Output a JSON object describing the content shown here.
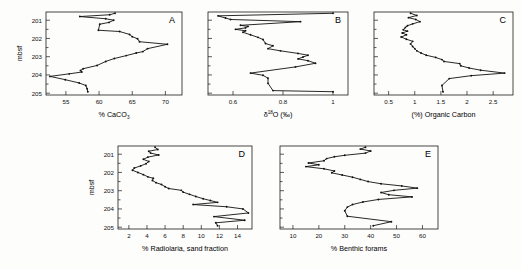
{
  "figure": {
    "background": "#fdfdfc",
    "line_color": "#111111",
    "axis_color": "#1a1a1a",
    "depth_axis_label": "mbsf",
    "depth_ticks": [
      201,
      202,
      203,
      204,
      205
    ],
    "depth_range": [
      200.55,
      205.1
    ]
  },
  "panels": [
    {
      "id": "A",
      "letter": "A",
      "xlabel_parts": {
        "pre": "% CaCO",
        "sub": "3",
        "post": ""
      },
      "xlabel": "% CaCO3",
      "ylabel": "mbsf",
      "xticks": [
        55,
        60,
        65,
        70
      ],
      "xlim": [
        52.0,
        72.5
      ],
      "ylim": [
        200.55,
        205.1
      ]
    },
    {
      "id": "B",
      "letter": "B",
      "xlabel_parts": {
        "pre": "δ",
        "sup": "18",
        "post": "O (‰)"
      },
      "xlabel": "δ18O (‰)",
      "ylabel": "",
      "xticks": [
        0.6,
        0.8,
        1.0
      ],
      "xlim": [
        0.5,
        1.06
      ],
      "ylim": [
        200.55,
        205.1
      ]
    },
    {
      "id": "C",
      "letter": "C",
      "xlabel_parts": {
        "pre": "(%) Organic Carbon"
      },
      "xlabel": "(%) Organic Carbon",
      "ylabel": "",
      "xticks": [
        0.5,
        1.0,
        1.5,
        2.0,
        2.5
      ],
      "xlim": [
        0.22,
        2.88
      ],
      "ylim": [
        200.55,
        205.1
      ]
    },
    {
      "id": "D",
      "letter": "D",
      "xlabel_parts": {
        "pre": "% Radiolaria, sand fraction"
      },
      "xlabel": "% Radiolaria, sand fraction",
      "ylabel": "mbsf",
      "xticks": [
        2,
        4,
        6,
        8,
        10,
        12,
        14
      ],
      "xlim": [
        0.8,
        15.6
      ],
      "ylim": [
        200.55,
        205.1
      ]
    },
    {
      "id": "E",
      "letter": "E",
      "xlabel_parts": {
        "pre": "% Benthic forams"
      },
      "xlabel": "% Benthic forams",
      "ylabel": "",
      "xticks": [
        10,
        20,
        30,
        40,
        50,
        60
      ],
      "xlim": [
        5,
        66
      ],
      "ylim": [
        200.55,
        205.1
      ]
    }
  ],
  "chart_data": [
    {
      "type": "line",
      "panel": "A",
      "title": "",
      "xlabel": "% CaCO3",
      "ylabel": "mbsf",
      "xlim": [
        52.0,
        72.5
      ],
      "ylim": [
        205.1,
        200.55
      ],
      "y_inverted": true,
      "grid": false,
      "legend": false,
      "xticks": [
        55,
        60,
        65,
        70
      ],
      "yticks": [
        201,
        202,
        203,
        204,
        205
      ],
      "x": [
        62.4,
        61.6,
        57.1,
        61.0,
        62.2,
        61.5,
        60.1,
        59.9,
        63.1,
        64.6,
        65.0,
        65.8,
        66.1,
        70.3,
        67.3,
        66.6,
        65.6,
        64.1,
        62.3,
        61.0,
        59.7,
        57.6,
        57.2,
        57.4,
        55.5,
        52.6,
        54.9,
        57.0,
        58.0,
        58.2,
        58.3
      ],
      "y": [
        200.62,
        200.7,
        200.8,
        200.92,
        201.0,
        201.12,
        201.22,
        201.55,
        201.62,
        201.78,
        201.9,
        202.02,
        202.18,
        202.32,
        202.56,
        202.72,
        202.8,
        202.94,
        203.1,
        203.26,
        203.48,
        203.66,
        203.76,
        203.84,
        203.94,
        204.08,
        204.26,
        204.44,
        204.58,
        204.76,
        204.92
      ]
    },
    {
      "type": "line",
      "panel": "B",
      "title": "",
      "xlabel": "δ18O (‰)",
      "ylabel": "mbsf",
      "xlim": [
        0.5,
        1.06
      ],
      "ylim": [
        205.1,
        200.55
      ],
      "y_inverted": true,
      "grid": false,
      "legend": false,
      "xticks": [
        0.6,
        0.8,
        1.0
      ],
      "yticks": [
        201,
        202,
        203,
        204,
        205
      ],
      "x": [
        1.0,
        0.54,
        0.57,
        0.59,
        0.87,
        0.63,
        0.66,
        0.65,
        0.61,
        0.65,
        0.64,
        0.67,
        0.7,
        0.72,
        0.73,
        0.76,
        0.74,
        0.79,
        0.86,
        0.9,
        0.88,
        0.86,
        0.9,
        0.93,
        0.85,
        0.67,
        0.72,
        0.74,
        0.74,
        0.76,
        1.0
      ],
      "y": [
        200.62,
        200.76,
        200.88,
        200.96,
        201.08,
        201.28,
        201.34,
        201.42,
        201.5,
        201.58,
        201.66,
        201.8,
        201.94,
        202.06,
        202.28,
        202.4,
        202.56,
        202.68,
        202.82,
        202.92,
        203.02,
        203.12,
        203.22,
        203.36,
        203.56,
        203.9,
        204.02,
        204.18,
        204.46,
        204.86,
        204.92
      ]
    },
    {
      "type": "line",
      "panel": "C",
      "title": "",
      "xlabel": "(%) Organic Carbon",
      "ylabel": "mbsf",
      "xlim": [
        0.22,
        2.88
      ],
      "ylim": [
        205.1,
        200.55
      ],
      "y_inverted": true,
      "grid": false,
      "legend": false,
      "xticks": [
        0.5,
        1.0,
        1.5,
        2.0,
        2.5
      ],
      "yticks": [
        201,
        202,
        203,
        204,
        205
      ],
      "x": [
        0.92,
        1.04,
        0.88,
        1.02,
        1.1,
        0.96,
        0.86,
        0.82,
        0.78,
        0.86,
        0.76,
        0.84,
        0.74,
        0.84,
        0.96,
        0.92,
        0.96,
        1.0,
        1.04,
        1.12,
        1.22,
        1.4,
        1.52,
        1.56,
        1.86,
        1.88,
        2.04,
        2.26,
        2.72,
        2.08,
        1.66,
        1.52,
        1.54
      ],
      "y": [
        200.62,
        200.74,
        200.86,
        200.96,
        201.08,
        201.2,
        201.3,
        201.4,
        201.52,
        201.6,
        201.7,
        201.8,
        201.92,
        202.04,
        202.16,
        202.3,
        202.44,
        202.56,
        202.68,
        202.8,
        202.92,
        203.04,
        203.16,
        203.26,
        203.38,
        203.5,
        203.62,
        203.74,
        203.9,
        204.04,
        204.2,
        204.58,
        204.92
      ]
    },
    {
      "type": "line",
      "panel": "D",
      "title": "",
      "xlabel": "% Radiolaria, sand fraction",
      "ylabel": "mbsf",
      "xlim": [
        0.8,
        15.6
      ],
      "ylim": [
        205.1,
        200.55
      ],
      "y_inverted": true,
      "grid": false,
      "legend": false,
      "xticks": [
        2,
        4,
        6,
        8,
        10,
        12,
        14
      ],
      "yticks": [
        201,
        202,
        203,
        204,
        205
      ],
      "x": [
        4.9,
        5.2,
        4.2,
        4.4,
        5.3,
        4.1,
        3.6,
        4.2,
        3.9,
        3.3,
        2.6,
        2.4,
        3.0,
        3.6,
        4.1,
        4.7,
        4.6,
        5.0,
        5.6,
        6.0,
        6.4,
        7.8,
        8.0,
        8.7,
        9.4,
        10.2,
        11.0,
        11.8,
        9.1,
        12.8,
        14.6,
        15.2,
        11.4,
        14.8,
        11.6,
        11.8
      ],
      "y": [
        200.62,
        200.74,
        200.84,
        200.94,
        201.04,
        201.16,
        201.28,
        201.4,
        201.52,
        201.64,
        201.76,
        201.88,
        202.0,
        202.12,
        202.24,
        202.32,
        202.44,
        202.56,
        202.66,
        202.78,
        202.88,
        202.98,
        203.08,
        203.2,
        203.32,
        203.44,
        203.54,
        203.64,
        203.76,
        203.88,
        204.0,
        204.22,
        204.42,
        204.62,
        204.76,
        204.92
      ]
    },
    {
      "type": "line",
      "panel": "E",
      "title": "",
      "xlabel": "% Benthic forams",
      "ylabel": "mbsf",
      "xlim": [
        5,
        66
      ],
      "ylim": [
        205.1,
        200.55
      ],
      "y_inverted": true,
      "grid": false,
      "legend": false,
      "xticks": [
        10,
        20,
        30,
        40,
        50,
        60
      ],
      "yticks": [
        201,
        202,
        203,
        204,
        205
      ],
      "x": [
        38,
        36,
        40,
        38,
        30,
        26,
        23,
        22,
        16,
        20,
        15,
        22,
        26,
        25,
        29,
        33,
        36,
        39,
        44,
        52,
        58,
        49,
        44,
        47,
        56,
        43,
        37,
        33,
        31,
        30,
        31,
        48,
        41
      ],
      "y": [
        200.62,
        200.72,
        200.82,
        200.94,
        201.06,
        201.14,
        201.24,
        201.36,
        201.48,
        201.58,
        201.68,
        201.8,
        201.92,
        202.02,
        202.14,
        202.26,
        202.38,
        202.5,
        202.62,
        202.74,
        202.86,
        202.98,
        203.1,
        203.22,
        203.34,
        203.48,
        203.62,
        203.76,
        203.9,
        204.1,
        204.4,
        204.7,
        204.92
      ]
    }
  ]
}
